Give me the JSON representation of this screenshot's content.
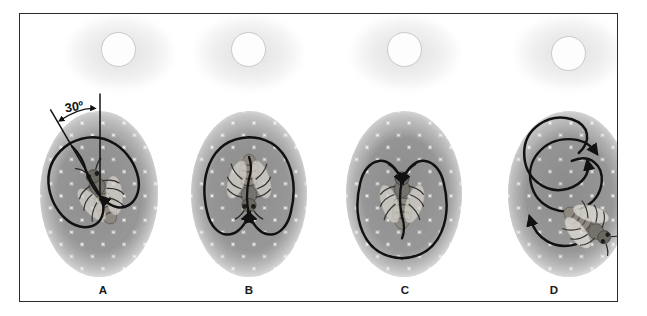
{
  "figure": {
    "caption_letters": [
      "A",
      "B",
      "C",
      "D"
    ],
    "angle_annotation": {
      "label": "30º",
      "value": 30,
      "unit": "degrees",
      "panel": "A"
    },
    "frame": {
      "border_color": "#2b2b2b",
      "background_color": "#ffffff"
    },
    "colors": {
      "comb_cell_fill": "#9c9c9c",
      "comb_cell_wall": "#f2f2f2",
      "dance_path": "#111111",
      "sun_disc_fill": "#fdfdfd",
      "sun_disc_outline": "#c9c9c9",
      "bee_body": "#6e6a63",
      "label_text": "#1a1a1a"
    }
  },
  "panels": [
    {
      "id": "panel-a",
      "letter": "A",
      "sun_symbol": "sun-icon",
      "dance_type": "waggle-dance",
      "dance_orientation_label": "30º",
      "bee_heading": "up-left-30-degrees",
      "description": "Bee performing a waggle dance with the figure-eight tilted 30 degrees from vertical; an angle marker shows 30º between the vertical reference line and the waggle run axis."
    },
    {
      "id": "panel-b",
      "letter": "B",
      "sun_symbol": "sun-icon",
      "dance_type": "waggle-dance",
      "dance_orientation_label": "straight-down",
      "bee_heading": "down",
      "description": "Bee performing a vertical waggle dance with the waggle run pointing straight down; the bee faces downward."
    },
    {
      "id": "panel-c",
      "letter": "C",
      "sun_symbol": "sun-icon",
      "dance_type": "waggle-dance",
      "dance_orientation_label": "straight-up",
      "bee_heading": "up",
      "description": "Bee performing a vertical waggle dance with the waggle run pointing straight up; the bee faces upward."
    },
    {
      "id": "panel-d",
      "letter": "D",
      "sun_symbol": "sun-icon",
      "dance_type": "round-dance",
      "dance_orientation_label": "circular",
      "bee_heading": "lower-right",
      "description": "Bee performing a round dance: overlapping circular loops with no waggle-run direction; the bee is at the lower right of the comb patch."
    }
  ]
}
